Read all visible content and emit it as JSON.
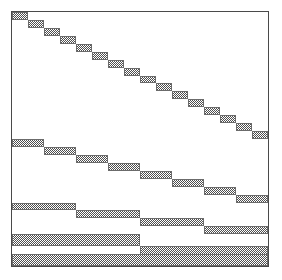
{
  "figure": {
    "type": "block-sparsity-pattern",
    "title": "",
    "width": 282,
    "height": 280,
    "background_color": "#ffffff"
  },
  "frame": {
    "x": 11,
    "y": 11,
    "width": 258,
    "height": 256,
    "border_color": "#4a4a4a",
    "border_width": 1,
    "fill_color": "#ffffff"
  },
  "chart_data": {
    "type": "heatmap",
    "title": "",
    "xlabel": "",
    "ylabel": "",
    "xlim": [
      0,
      256
    ],
    "ylim": [
      0,
      256
    ],
    "grid": false,
    "legend": "none",
    "block_fill_color": "#4f4f4f",
    "block_edge_color": "#6b6b6b",
    "levels": [
      {
        "level": 1,
        "band_top": 0,
        "block_count": 16,
        "block_width": 16,
        "block_height": 8,
        "x_step": 16,
        "y_step": 8,
        "blocks": [
          {
            "x": 0,
            "y": 0,
            "w": 16,
            "h": 8
          },
          {
            "x": 16,
            "y": 8,
            "w": 16,
            "h": 8
          },
          {
            "x": 32,
            "y": 16,
            "w": 16,
            "h": 8
          },
          {
            "x": 48,
            "y": 24,
            "w": 16,
            "h": 8
          },
          {
            "x": 64,
            "y": 32,
            "w": 16,
            "h": 8
          },
          {
            "x": 80,
            "y": 40,
            "w": 16,
            "h": 8
          },
          {
            "x": 96,
            "y": 48,
            "w": 16,
            "h": 8
          },
          {
            "x": 112,
            "y": 56,
            "w": 16,
            "h": 8
          },
          {
            "x": 128,
            "y": 64,
            "w": 16,
            "h": 8
          },
          {
            "x": 144,
            "y": 72,
            "w": 16,
            "h": 8
          },
          {
            "x": 160,
            "y": 80,
            "w": 16,
            "h": 8
          },
          {
            "x": 176,
            "y": 88,
            "w": 16,
            "h": 8
          },
          {
            "x": 192,
            "y": 96,
            "w": 16,
            "h": 8
          },
          {
            "x": 208,
            "y": 104,
            "w": 16,
            "h": 8
          },
          {
            "x": 224,
            "y": 112,
            "w": 16,
            "h": 8
          },
          {
            "x": 240,
            "y": 120,
            "w": 16,
            "h": 8
          }
        ]
      },
      {
        "level": 2,
        "band_top": 128,
        "block_count": 8,
        "block_width": 32,
        "block_height": 8,
        "x_step": 32,
        "y_step": 8,
        "blocks": [
          {
            "x": 0,
            "y": 128,
            "w": 32,
            "h": 8
          },
          {
            "x": 32,
            "y": 136,
            "w": 32,
            "h": 8
          },
          {
            "x": 64,
            "y": 144,
            "w": 32,
            "h": 8
          },
          {
            "x": 96,
            "y": 152,
            "w": 32,
            "h": 8
          },
          {
            "x": 128,
            "y": 160,
            "w": 32,
            "h": 8
          },
          {
            "x": 160,
            "y": 168,
            "w": 32,
            "h": 8
          },
          {
            "x": 192,
            "y": 176,
            "w": 32,
            "h": 8
          },
          {
            "x": 224,
            "y": 184,
            "w": 32,
            "h": 8
          }
        ]
      },
      {
        "level": 3,
        "band_top": 192,
        "block_count": 4,
        "block_width": 64,
        "block_height": 8,
        "x_step": 64,
        "y_step": 8,
        "blocks": [
          {
            "x": 0,
            "y": 192,
            "w": 64,
            "h": 8
          },
          {
            "x": 64,
            "y": 200,
            "w": 64,
            "h": 8
          },
          {
            "x": 128,
            "y": 208,
            "w": 64,
            "h": 8
          },
          {
            "x": 192,
            "y": 216,
            "w": 64,
            "h": 8
          }
        ]
      },
      {
        "level": 4,
        "band_top": 224,
        "block_count": 2,
        "block_width": 128,
        "block_height": 12,
        "x_step": 128,
        "y_step": 12,
        "blocks": [
          {
            "x": 0,
            "y": 224,
            "w": 128,
            "h": 12
          },
          {
            "x": 128,
            "y": 236,
            "w": 128,
            "h": 12
          }
        ]
      },
      {
        "level": 5,
        "band_top": 244,
        "block_count": 1,
        "block_width": 256,
        "block_height": 12,
        "x_step": 256,
        "y_step": 12,
        "blocks": [
          {
            "x": 0,
            "y": 244,
            "w": 256,
            "h": 12
          }
        ]
      }
    ]
  }
}
